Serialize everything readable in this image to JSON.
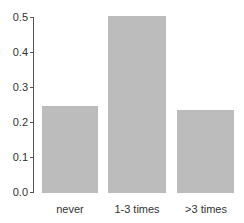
{
  "chart_data": {
    "type": "bar",
    "title": "",
    "xlabel": "",
    "ylabel": "",
    "categories": [
      "never",
      "1-3 times",
      ">3 times"
    ],
    "values": [
      0.25,
      0.505,
      0.237
    ],
    "ylim": [
      0,
      0.5
    ],
    "yticks": [
      "0.0",
      "0.1",
      "0.2",
      "0.3",
      "0.4",
      "0.5"
    ],
    "grid": false,
    "bar_color": "#bcbcbc"
  }
}
